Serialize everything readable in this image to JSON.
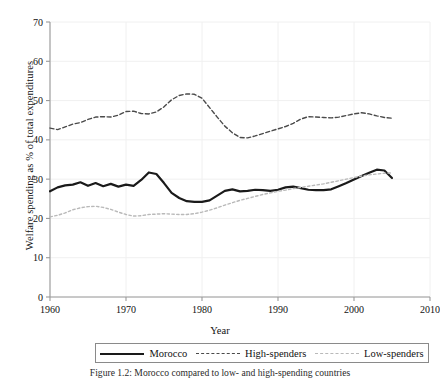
{
  "chart_data": {
    "type": "line",
    "title": "",
    "xlabel": "Year",
    "ylabel": "Welfare spending as % of total expenditures",
    "xlim": [
      1960,
      2010
    ],
    "ylim": [
      0,
      70
    ],
    "xticks": [
      1960,
      1970,
      1980,
      1990,
      2000,
      2010
    ],
    "yticks": [
      0,
      10,
      20,
      30,
      40,
      50,
      60,
      70
    ],
    "grid": true,
    "legend_position": "bottom",
    "x": [
      1960,
      1961,
      1962,
      1963,
      1964,
      1965,
      1966,
      1967,
      1968,
      1969,
      1970,
      1971,
      1972,
      1973,
      1974,
      1975,
      1976,
      1977,
      1978,
      1979,
      1980,
      1981,
      1982,
      1983,
      1984,
      1985,
      1986,
      1987,
      1988,
      1989,
      1990,
      1991,
      1992,
      1993,
      1994,
      1995,
      1996,
      1997,
      1998,
      1999,
      2000,
      2001,
      2002,
      2003,
      2004,
      2005
    ],
    "series": [
      {
        "name": "Morocco",
        "style": "solid",
        "color": "#1a1a1a",
        "values": [
          26.9,
          27.9,
          28.4,
          28.6,
          29.2,
          28.3,
          29.0,
          28.2,
          28.8,
          28.1,
          28.6,
          28.3,
          29.8,
          31.7,
          31.3,
          29.0,
          26.5,
          25.2,
          24.4,
          24.2,
          24.2,
          24.6,
          25.8,
          27.0,
          27.4,
          26.9,
          27.0,
          27.3,
          27.2,
          27.0,
          27.3,
          27.9,
          28.1,
          27.7,
          27.3,
          27.2,
          27.2,
          27.4,
          28.2,
          29.0,
          29.9,
          30.8,
          31.6,
          32.4,
          32.2,
          30.3
        ]
      },
      {
        "name": "High-spenders",
        "style": "dashed",
        "color": "#4a4a4a",
        "values": [
          43.0,
          42.6,
          43.3,
          44.0,
          44.4,
          45.2,
          45.8,
          45.9,
          45.8,
          46.3,
          47.2,
          47.3,
          46.7,
          46.6,
          47.1,
          48.4,
          50.2,
          51.3,
          51.7,
          51.6,
          50.6,
          48.2,
          45.8,
          43.5,
          41.8,
          40.6,
          40.5,
          41.0,
          41.6,
          42.2,
          42.8,
          43.4,
          44.2,
          45.3,
          45.9,
          45.8,
          45.7,
          45.6,
          45.8,
          46.2,
          46.6,
          46.9,
          46.6,
          46.1,
          45.7,
          45.5
        ]
      },
      {
        "name": "Low-spenders",
        "style": "dashed",
        "color": "#b9b9b9",
        "values": [
          20.4,
          20.8,
          21.4,
          22.2,
          22.7,
          23.0,
          23.1,
          22.8,
          22.3,
          21.6,
          21.0,
          20.6,
          20.7,
          21.0,
          21.1,
          21.2,
          21.1,
          21.0,
          21.0,
          21.2,
          21.6,
          22.1,
          22.7,
          23.4,
          24.0,
          24.6,
          25.1,
          25.6,
          26.1,
          26.5,
          26.9,
          27.2,
          27.6,
          27.9,
          28.2,
          28.5,
          28.8,
          29.2,
          29.6,
          30.0,
          30.4,
          30.8,
          31.1,
          31.3,
          31.5,
          31.6
        ]
      }
    ]
  },
  "legend": {
    "items": [
      {
        "label": "Morocco"
      },
      {
        "label": "High-spenders"
      },
      {
        "label": "Low-spenders"
      }
    ]
  },
  "caption": "Figure 1.2: Morocco compared to low- and high-spending countries"
}
